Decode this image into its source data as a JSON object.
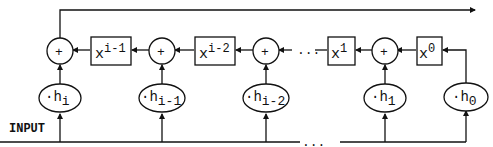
{
  "diagram": {
    "input_label": "INPUT",
    "dots": "...",
    "delay_boxes": [
      {
        "base": "x",
        "exp": "i-1"
      },
      {
        "base": "x",
        "exp": "i-2"
      },
      {
        "base": "x",
        "exp": "1"
      },
      {
        "base": "x",
        "exp": "0"
      }
    ],
    "adders": [
      "+",
      "+",
      "+",
      "+"
    ],
    "coefficients": [
      {
        "prefix": "·h",
        "sub": "i"
      },
      {
        "prefix": "·h",
        "sub": "i-1"
      },
      {
        "prefix": "·h",
        "sub": "i-2"
      },
      {
        "prefix": "·h",
        "sub": "1"
      },
      {
        "prefix": "·h",
        "sub": "0"
      }
    ]
  }
}
